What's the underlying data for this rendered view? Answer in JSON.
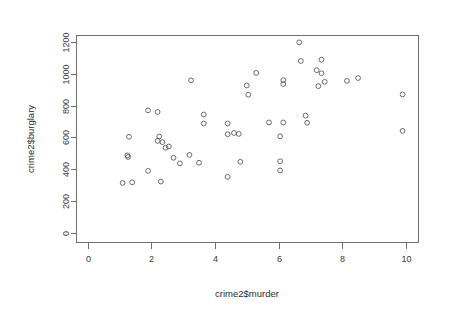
{
  "chart_data": {
    "type": "scatter",
    "title": "",
    "xlabel": "crime2$murder",
    "ylabel": "crime2$burglary",
    "xlim": [
      -0.35,
      10.4
    ],
    "ylim": [
      -60,
      1240
    ],
    "xticks": [
      0,
      2,
      4,
      6,
      8,
      10
    ],
    "yticks": [
      0,
      200,
      400,
      600,
      800,
      1000,
      1200
    ],
    "xtick_labels": [
      "0",
      "2",
      "4",
      "6",
      "8",
      "10"
    ],
    "ytick_labels": [
      "0",
      "200",
      "400",
      "600",
      "800",
      "1000",
      "1200"
    ],
    "grid": false,
    "legend": null,
    "marker": "open-circle",
    "marker_color": "#5b5b5b",
    "points": [
      {
        "x": 1.1,
        "y": 314
      },
      {
        "x": 1.25,
        "y": 487
      },
      {
        "x": 1.27,
        "y": 477
      },
      {
        "x": 1.3,
        "y": 604
      },
      {
        "x": 1.4,
        "y": 318
      },
      {
        "x": 1.9,
        "y": 770
      },
      {
        "x": 1.9,
        "y": 390
      },
      {
        "x": 2.2,
        "y": 760
      },
      {
        "x": 2.25,
        "y": 606
      },
      {
        "x": 2.2,
        "y": 578
      },
      {
        "x": 2.3,
        "y": 323
      },
      {
        "x": 2.35,
        "y": 570
      },
      {
        "x": 2.45,
        "y": 535
      },
      {
        "x": 2.55,
        "y": 543
      },
      {
        "x": 2.7,
        "y": 472
      },
      {
        "x": 2.9,
        "y": 437
      },
      {
        "x": 3.2,
        "y": 490
      },
      {
        "x": 3.25,
        "y": 958
      },
      {
        "x": 3.5,
        "y": 441
      },
      {
        "x": 3.65,
        "y": 744
      },
      {
        "x": 3.65,
        "y": 687
      },
      {
        "x": 4.4,
        "y": 687
      },
      {
        "x": 4.4,
        "y": 620
      },
      {
        "x": 4.4,
        "y": 352
      },
      {
        "x": 4.6,
        "y": 628
      },
      {
        "x": 4.75,
        "y": 622
      },
      {
        "x": 4.8,
        "y": 447
      },
      {
        "x": 5.0,
        "y": 926
      },
      {
        "x": 5.05,
        "y": 868
      },
      {
        "x": 5.3,
        "y": 1005
      },
      {
        "x": 5.7,
        "y": 694
      },
      {
        "x": 6.05,
        "y": 607
      },
      {
        "x": 6.05,
        "y": 450
      },
      {
        "x": 6.05,
        "y": 392
      },
      {
        "x": 6.15,
        "y": 960
      },
      {
        "x": 6.15,
        "y": 935
      },
      {
        "x": 6.15,
        "y": 694
      },
      {
        "x": 6.65,
        "y": 1197
      },
      {
        "x": 6.7,
        "y": 1080
      },
      {
        "x": 6.85,
        "y": 737
      },
      {
        "x": 6.9,
        "y": 692
      },
      {
        "x": 7.2,
        "y": 1022
      },
      {
        "x": 7.25,
        "y": 922
      },
      {
        "x": 7.35,
        "y": 1088
      },
      {
        "x": 7.35,
        "y": 1003
      },
      {
        "x": 7.45,
        "y": 949
      },
      {
        "x": 8.15,
        "y": 955
      },
      {
        "x": 8.5,
        "y": 973
      },
      {
        "x": 9.9,
        "y": 870
      },
      {
        "x": 9.9,
        "y": 641
      }
    ]
  },
  "axes": {
    "x_axis_name": "crime2$murder",
    "y_axis_name": "crime2$burglary"
  }
}
